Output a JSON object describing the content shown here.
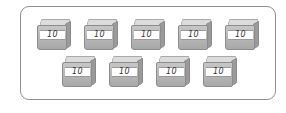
{
  "figure": {
    "rows": [
      {
        "boxes": [
          {
            "label": "10"
          },
          {
            "label": "10"
          },
          {
            "label": "10"
          },
          {
            "label": "10"
          },
          {
            "label": "10"
          }
        ]
      },
      {
        "boxes": [
          {
            "label": "10"
          },
          {
            "label": "10"
          },
          {
            "label": "10"
          },
          {
            "label": "10"
          }
        ]
      }
    ],
    "colors": {
      "border": "#8f8f8f",
      "box_top": "#dcdcdc",
      "box_front": "#b5b5b5",
      "box_side": "#9a9a9a",
      "label_bg": "#ffffff"
    }
  }
}
